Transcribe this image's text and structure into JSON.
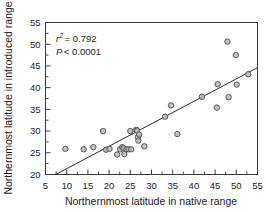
{
  "figure": {
    "background": "#ffffff",
    "frame_color": "#3a3a3a",
    "point_fill": "#b9b9b9",
    "point_stroke": "#4a4a4a",
    "line_color": "#2b2b2b"
  },
  "annotations": {
    "r_symbol": "r",
    "r_exponent": "2",
    "r_value": "= 0.792",
    "p_symbol": "P",
    "p_value": "< 0.0001"
  },
  "chart_data": {
    "type": "scatter",
    "title": "",
    "xlabel": "Northernmost latitude in native range",
    "ylabel": "Northernmost latitude in introduced range",
    "xlim": [
      5,
      55
    ],
    "ylim": [
      20,
      55
    ],
    "xticks": [
      5,
      10,
      15,
      20,
      25,
      30,
      35,
      40,
      45,
      50,
      55
    ],
    "yticks": [
      20,
      25,
      30,
      35,
      40,
      45,
      50,
      55
    ],
    "xtick_labels": [
      "5",
      "10",
      "15",
      "20",
      "25",
      "30",
      "35",
      "40",
      "45",
      "50",
      "55"
    ],
    "ytick_labels": [
      "20",
      "25",
      "30",
      "35",
      "40",
      "45",
      "50",
      "55"
    ],
    "minor_tick_step_x": 2.5,
    "minor_tick_step_y": 2.5,
    "grid": false,
    "legend": false,
    "r_squared": 0.792,
    "p_value": "< 0.0001",
    "trendline": {
      "type": "linear",
      "x_start": 7.4,
      "y_start": 20.0,
      "x_end": 55.0,
      "y_end": 44.6
    },
    "points": [
      {
        "x": 9.7,
        "y": 25.9
      },
      {
        "x": 14.0,
        "y": 25.8
      },
      {
        "x": 16.3,
        "y": 26.3
      },
      {
        "x": 18.6,
        "y": 30.0
      },
      {
        "x": 19.3,
        "y": 25.7
      },
      {
        "x": 20.1,
        "y": 25.9
      },
      {
        "x": 21.9,
        "y": 24.6
      },
      {
        "x": 22.6,
        "y": 25.8
      },
      {
        "x": 23.1,
        "y": 26.3
      },
      {
        "x": 23.4,
        "y": 26.1
      },
      {
        "x": 23.6,
        "y": 24.7
      },
      {
        "x": 24.1,
        "y": 25.8
      },
      {
        "x": 24.6,
        "y": 25.8
      },
      {
        "x": 25.0,
        "y": 30.0
      },
      {
        "x": 25.2,
        "y": 25.8
      },
      {
        "x": 26.4,
        "y": 30.3
      },
      {
        "x": 26.6,
        "y": 30.1
      },
      {
        "x": 26.8,
        "y": 28.6
      },
      {
        "x": 26.9,
        "y": 27.8
      },
      {
        "x": 27.1,
        "y": 29.2
      },
      {
        "x": 28.3,
        "y": 26.5
      },
      {
        "x": 33.2,
        "y": 33.3
      },
      {
        "x": 34.6,
        "y": 35.9
      },
      {
        "x": 36.1,
        "y": 29.3
      },
      {
        "x": 41.9,
        "y": 37.9
      },
      {
        "x": 45.4,
        "y": 35.4
      },
      {
        "x": 45.6,
        "y": 40.8
      },
      {
        "x": 47.9,
        "y": 50.6
      },
      {
        "x": 48.2,
        "y": 37.8
      },
      {
        "x": 49.9,
        "y": 47.5
      },
      {
        "x": 50.1,
        "y": 40.7
      },
      {
        "x": 52.8,
        "y": 43.1
      }
    ]
  }
}
